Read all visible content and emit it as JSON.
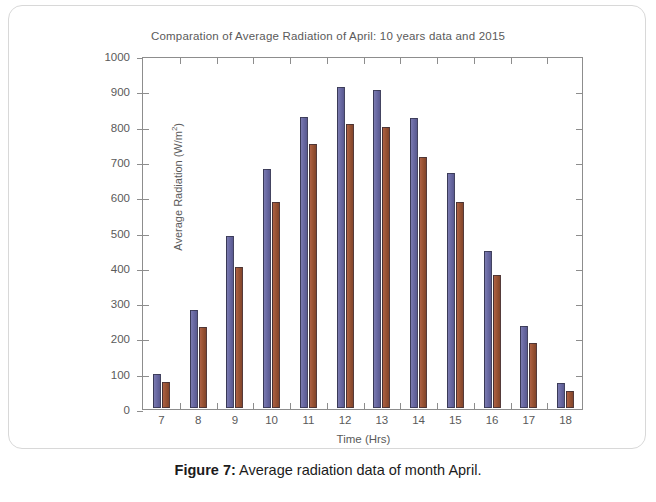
{
  "figure": {
    "caption_prefix": "Figure 7",
    "caption_separator": ":",
    "caption_text": "Average radiation data of month April."
  },
  "colors": {
    "series_a": "#6a6aa4",
    "series_b": "#9b5434",
    "axis": "#8d8d8d",
    "text": "#5a5a5a",
    "frame": "#d8d8d8"
  },
  "chart_data": {
    "type": "bar",
    "title": "Comparation of Average Radiation of April: 10 years data and 2015",
    "xlabel": "Time (Hrs)",
    "ylabel": "Average Radiation (W/m²)",
    "ylabel_unit_base": "Average Radiation (W/m",
    "ylabel_unit_sup": "2",
    "ylabel_unit_close": ")",
    "categories": [
      "7",
      "8",
      "9",
      "10",
      "11",
      "12",
      "13",
      "14",
      "15",
      "16",
      "17",
      "18"
    ],
    "series": [
      {
        "name": "10 years data",
        "color": "#6a6aa4",
        "values": [
          95,
          278,
          488,
          678,
          825,
          908,
          900,
          822,
          665,
          445,
          232,
          70
        ]
      },
      {
        "name": "2015",
        "color": "#9b5434",
        "values": [
          75,
          229,
          400,
          585,
          748,
          805,
          797,
          710,
          585,
          378,
          183,
          47
        ]
      }
    ],
    "ylim": [
      0,
      1000
    ],
    "ytick_values": [
      0,
      100,
      200,
      300,
      400,
      500,
      600,
      700,
      800,
      900,
      1000
    ],
    "ytick_labels": [
      "0",
      "100",
      "200",
      "300",
      "400",
      "500",
      "600",
      "700",
      "800",
      "900",
      "1000"
    ],
    "grid": false,
    "legend": "none",
    "xtick_count": 12
  }
}
